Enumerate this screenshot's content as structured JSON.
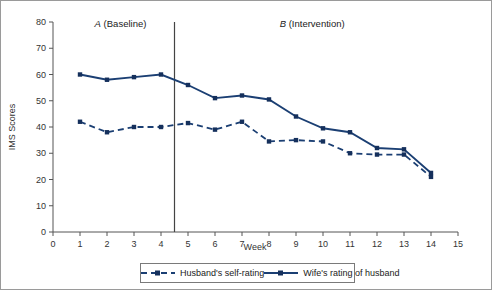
{
  "chart_data": {
    "type": "line",
    "title": "",
    "xlabel": "Week",
    "ylabel": "IMS Scores",
    "xlim": [
      0,
      15
    ],
    "ylim": [
      0,
      80
    ],
    "xticks": [
      0,
      1,
      2,
      3,
      4,
      5,
      6,
      7,
      8,
      9,
      10,
      11,
      12,
      13,
      14,
      15
    ],
    "yticks": [
      0,
      10,
      20,
      30,
      40,
      50,
      60,
      70,
      80
    ],
    "grid": false,
    "legend_position": "bottom",
    "phase_change_x": 4.5,
    "annotations": [
      {
        "text_letter": "A",
        "text_rest": " (Baseline)",
        "x": 2.5,
        "y": 78
      },
      {
        "text_letter": "B",
        "text_rest": " (Intervention)",
        "x": 9.6,
        "y": 78
      }
    ],
    "x": [
      1,
      2,
      3,
      4,
      5,
      6,
      7,
      8,
      9,
      10,
      11,
      12,
      13,
      14
    ],
    "series": [
      {
        "name": "Husband's self-rating",
        "style": "dashed",
        "values": [
          42,
          38,
          40,
          40,
          41.5,
          39,
          42,
          34.5,
          35,
          34.5,
          30,
          29.5,
          29.5,
          21
        ]
      },
      {
        "name": "Wife's rating of husband",
        "style": "solid",
        "values": [
          60,
          58,
          59,
          60,
          56,
          51,
          52,
          50.5,
          44,
          39.5,
          38,
          32,
          31.5,
          22.5
        ]
      }
    ],
    "accent_color": "#1b3f73",
    "marker_color": "#15305c"
  },
  "legend": {
    "entries": [
      {
        "label": "Husband's self-rating"
      },
      {
        "label": "Wife's rating of husband"
      }
    ]
  }
}
